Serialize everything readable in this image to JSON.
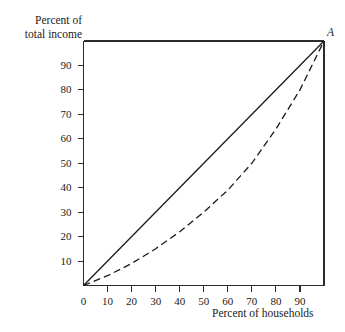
{
  "chart_data": {
    "type": "line",
    "title": "",
    "subtitle": "",
    "xlabel": "Percent of households",
    "ylabel": "Percent of total income",
    "xlim": [
      0,
      100
    ],
    "ylim": [
      0,
      100
    ],
    "grid": false,
    "legend": "none",
    "xticks": [
      0,
      10,
      20,
      30,
      40,
      50,
      60,
      70,
      80,
      90
    ],
    "xtick_labels": [
      "0",
      "10",
      "20",
      "30",
      "40",
      "50",
      "60",
      "70",
      "80",
      "90"
    ],
    "yticks": [
      10,
      20,
      30,
      40,
      50,
      60,
      70,
      80,
      90
    ],
    "ytick_labels": [
      "10",
      "20",
      "30",
      "40",
      "50",
      "60",
      "70",
      "80",
      "90"
    ],
    "annotations": [
      {
        "text": "A",
        "x": 100,
        "y": 100,
        "style": "italic"
      }
    ],
    "series": [
      {
        "name": "line-of-equality",
        "style": "solid",
        "color": "#1a1a1a",
        "x": [
          0,
          100
        ],
        "values": [
          0,
          100
        ]
      },
      {
        "name": "lorenz-curve",
        "style": "dashed",
        "color": "#1a1a1a",
        "x": [
          0,
          10,
          20,
          30,
          40,
          50,
          60,
          70,
          80,
          90,
          100
        ],
        "values": [
          0,
          4,
          9,
          15,
          22,
          30,
          39,
          50,
          64,
          80,
          100
        ]
      }
    ]
  },
  "axes": {
    "y_caption_line1": "Percent of",
    "y_caption_line2": "total income",
    "x_caption": "Percent of households"
  },
  "colors": {
    "ink": "#1a1a1a",
    "background": "#ffffff",
    "frame": "#2b2b2b"
  }
}
